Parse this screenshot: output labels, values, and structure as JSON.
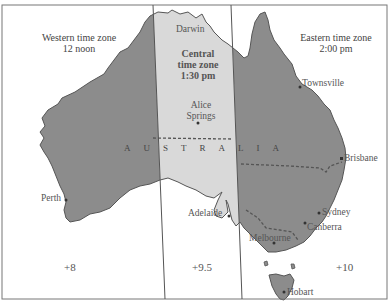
{
  "map": {
    "country_label": "AUSTRALIA",
    "zones": [
      {
        "id": "western",
        "name_line1": "Western time zone",
        "name_line2": "12 noon",
        "utc_offset": "+8",
        "shade": "#8c8c8c"
      },
      {
        "id": "central",
        "name_line1": "Central",
        "name_line2": "time zone",
        "name_line3": "1:30 pm",
        "utc_offset": "+9.5",
        "shade": "#d9d9d9"
      },
      {
        "id": "eastern",
        "name_line1": "Eastern time zone",
        "name_line2": "2:00 pm",
        "utc_offset": "+10",
        "shade": "#8c8c8c"
      }
    ],
    "cities": [
      {
        "name": "Darwin"
      },
      {
        "name_line1": "Alice",
        "name_line2": "Springs"
      },
      {
        "name": "Townsville"
      },
      {
        "name": "Brisbane"
      },
      {
        "name": "Perth"
      },
      {
        "name": "Adelaide"
      },
      {
        "name": "Sydney"
      },
      {
        "name": "Canberra"
      },
      {
        "name": "Melbourne"
      },
      {
        "name": "Hobart"
      }
    ]
  }
}
